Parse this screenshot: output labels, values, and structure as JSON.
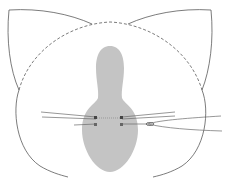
{
  "diagram": {
    "type": "line-art illustration",
    "colors": {
      "background": "#ffffff",
      "outline": "#5a5a5a",
      "fill_shape": "#c4c4c4",
      "whisker": "#6a6a6a"
    },
    "parts": [
      {
        "name": "head-outline",
        "style": "solid"
      },
      {
        "name": "head-top-dashed",
        "style": "dashed"
      },
      {
        "name": "left-ear",
        "style": "solid"
      },
      {
        "name": "right-ear",
        "style": "solid"
      },
      {
        "name": "nose-shape",
        "style": "gray fill"
      },
      {
        "name": "left-whiskers",
        "count": 3
      },
      {
        "name": "right-whiskers",
        "count": 4
      }
    ]
  }
}
